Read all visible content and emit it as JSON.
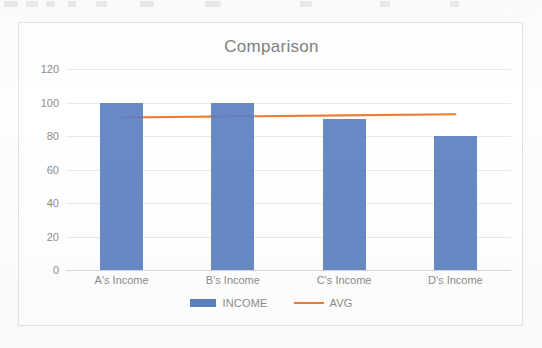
{
  "chart_data": {
    "type": "bar",
    "title": "Comparison",
    "categories": [
      "A's Income",
      "B's Income",
      "C's Income",
      "D's Income"
    ],
    "series": [
      {
        "name": "INCOME",
        "type": "bar",
        "color": "#5b7fc0",
        "values": [
          100,
          100,
          90,
          80
        ]
      },
      {
        "name": "AVG",
        "type": "line",
        "color": "#ED7D31",
        "values": [
          91,
          91.7,
          92.3,
          93
        ]
      }
    ],
    "xlabel": "",
    "ylabel": "",
    "ylim": [
      0,
      120
    ],
    "yticks": [
      0,
      20,
      40,
      60,
      80,
      100,
      120
    ],
    "ytick_labels": [
      "0",
      "20",
      "40",
      "60",
      "80",
      "100",
      "120"
    ],
    "grid": true,
    "legend_position": "bottom"
  },
  "legend": {
    "items": [
      {
        "label": "INCOME",
        "swatch": "bar-swatch",
        "color": "#5b7fc0"
      },
      {
        "label": "AVG",
        "swatch": "line-swatch",
        "color": "#ED7D31"
      }
    ]
  },
  "colors": {
    "bar": "#5b7fc0",
    "line": "#ED7D31",
    "text": "#8c8c8c",
    "title": "#7f7f7f",
    "grid": "#e9e9e9",
    "frame": "#e2e2e2",
    "background": "#ffffff"
  }
}
